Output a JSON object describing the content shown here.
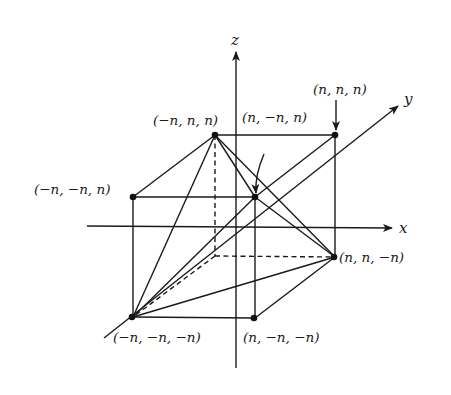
{
  "figure": {
    "axes": {
      "x": {
        "label": "x"
      },
      "y": {
        "label": "y"
      },
      "z": {
        "label": "z"
      }
    },
    "vertex_labels": {
      "top_back_left": "(−n, n, n)",
      "top_front_right": "(n, −n, n)",
      "top_back_right": "(n, n, n)",
      "top_front_left": "(−n, −n, n)",
      "bottom_back_right": "(n, n, −n)",
      "bottom_front_left": "(−n, −n, −n)",
      "bottom_front_right": "(n, −n, −n)"
    },
    "colors": {
      "ink": "#1a1a1a",
      "background": "#ffffff"
    }
  }
}
